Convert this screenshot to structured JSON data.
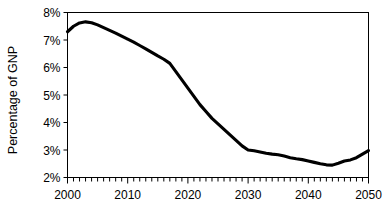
{
  "chart_data": {
    "type": "line",
    "title": "",
    "xlabel": "",
    "ylabel": "Percentage of GNP",
    "xlim": [
      2000,
      2050
    ],
    "ylim": [
      2,
      8
    ],
    "grid": false,
    "legend": false,
    "y_tick_labels": [
      "8%",
      "7%",
      "6%",
      "5%",
      "4%",
      "3%",
      "2%"
    ],
    "y_tick_values": [
      8,
      7,
      6,
      5,
      4,
      3,
      2
    ],
    "x_tick_labels": [
      "2000",
      "2010",
      "2020",
      "2030",
      "2040",
      "2050"
    ],
    "x_tick_values": [
      2000,
      2010,
      2020,
      2030,
      2040,
      2050
    ],
    "x_minor_tick_interval": 1,
    "series": [
      {
        "name": "Percentage of GNP",
        "color": "#000000",
        "x": [
          2000,
          2001,
          2002,
          2003,
          2004,
          2005,
          2006,
          2007,
          2008,
          2009,
          2010,
          2011,
          2012,
          2013,
          2014,
          2015,
          2016,
          2017,
          2018,
          2019,
          2020,
          2021,
          2022,
          2023,
          2024,
          2025,
          2026,
          2027,
          2028,
          2029,
          2030,
          2031,
          2032,
          2033,
          2034,
          2035,
          2036,
          2037,
          2038,
          2039,
          2040,
          2041,
          2042,
          2043,
          2044,
          2045,
          2046,
          2047,
          2048,
          2049,
          2050
        ],
        "values": [
          7.3,
          7.5,
          7.62,
          7.66,
          7.63,
          7.55,
          7.45,
          7.35,
          7.25,
          7.14,
          7.03,
          6.92,
          6.8,
          6.68,
          6.55,
          6.42,
          6.3,
          6.15,
          5.85,
          5.55,
          5.25,
          4.95,
          4.65,
          4.4,
          4.15,
          3.95,
          3.75,
          3.55,
          3.35,
          3.15,
          3.0,
          2.97,
          2.93,
          2.88,
          2.85,
          2.83,
          2.78,
          2.72,
          2.68,
          2.65,
          2.6,
          2.55,
          2.5,
          2.46,
          2.45,
          2.52,
          2.6,
          2.64,
          2.72,
          2.85,
          2.98
        ]
      }
    ]
  },
  "axis_title": {
    "y": "Percentage of GNP"
  }
}
